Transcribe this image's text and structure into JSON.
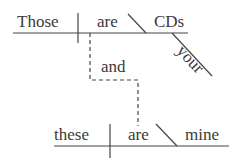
{
  "diagram": {
    "type": "sentence-diagram",
    "clause1": {
      "subject": "Those",
      "verb": "are",
      "complement": "CDs",
      "modifier": "your"
    },
    "conjunction": "and",
    "clause2": {
      "subject": "these",
      "verb": "are",
      "complement": "mine"
    },
    "line_color": "#444444"
  }
}
